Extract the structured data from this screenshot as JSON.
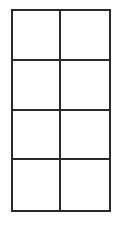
{
  "diagram": {
    "type": "grid",
    "rows": 4,
    "columns": 2,
    "line_color": "#2a2a2a",
    "cell_fill": "#ffffff",
    "cells": [
      {
        "row": 0,
        "col": 0,
        "label": ""
      },
      {
        "row": 0,
        "col": 1,
        "label": ""
      },
      {
        "row": 1,
        "col": 0,
        "label": ""
      },
      {
        "row": 1,
        "col": 1,
        "label": ""
      },
      {
        "row": 2,
        "col": 0,
        "label": ""
      },
      {
        "row": 2,
        "col": 1,
        "label": ""
      },
      {
        "row": 3,
        "col": 0,
        "label": ""
      },
      {
        "row": 3,
        "col": 1,
        "label": ""
      }
    ]
  }
}
